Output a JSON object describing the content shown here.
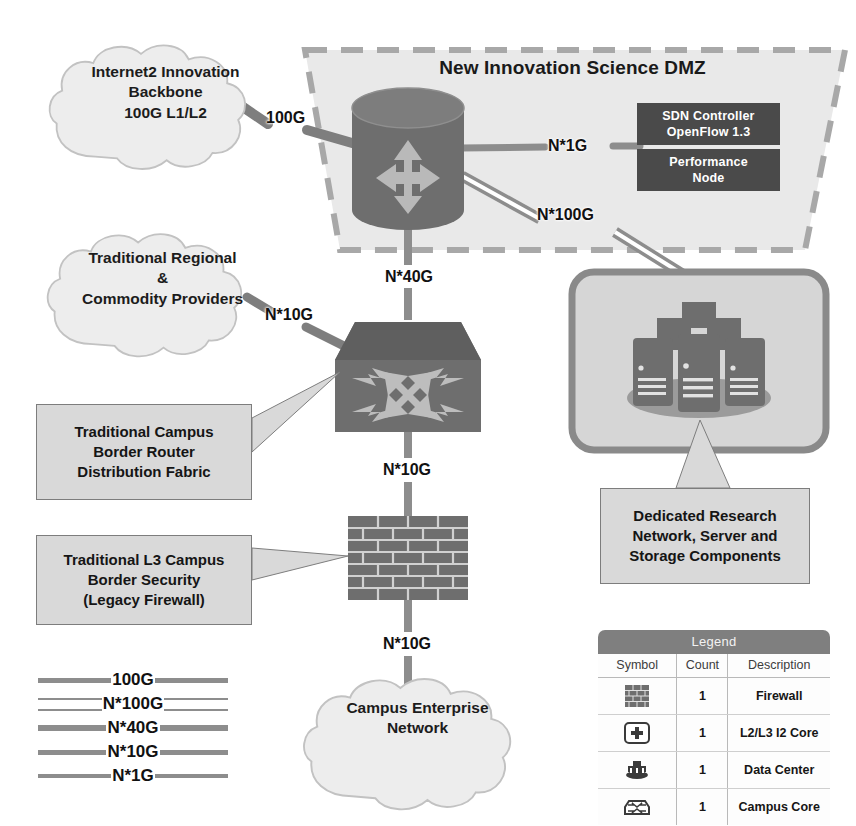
{
  "dmz": {
    "title": "New Innovation Science DMZ",
    "nodes": [
      {
        "id": "sdn-controller",
        "label": "SDN Controller\nOpenFlow 1.3",
        "line1": "SDN Controller",
        "line2": "OpenFlow 1.3"
      },
      {
        "id": "performance-node",
        "label": "Performance\nNode",
        "line1": "Performance",
        "line2": "Node"
      }
    ]
  },
  "clouds": [
    {
      "id": "internet2-backbone",
      "line1": "Internet2 Innovation",
      "line2": "Backbone",
      "line3": "100G L1/L2"
    },
    {
      "id": "regional-commodity",
      "line1": "Traditional Regional",
      "line2": "&",
      "line3": "Commodity Providers"
    },
    {
      "id": "campus-enterprise",
      "line1": "Campus Enterprise",
      "line2": "Network",
      "line3": ""
    }
  ],
  "callouts": [
    {
      "id": "border-router",
      "line1": "Traditional Campus",
      "line2": "Border Router",
      "line3": "Distribution Fabric"
    },
    {
      "id": "legacy-firewall",
      "line1": "Traditional L3 Campus",
      "line2": "Border Security",
      "line3": "(Legacy Firewall)"
    },
    {
      "id": "research-network",
      "line1": "Dedicated Research",
      "line2": "Network, Server and",
      "line3": "Storage Components"
    }
  ],
  "link_labels": {
    "internet2_to_core": "100G",
    "core_to_sdn": "N*1G",
    "core_to_datacenter": "N*100G",
    "core_to_campus_core": "N*40G",
    "regional_to_campus_core": "N*10G",
    "campus_core_to_firewall": "N*10G",
    "firewall_to_enterprise": "N*10G"
  },
  "line_legend": [
    {
      "label": "100G",
      "style": "solid",
      "thickness": 5
    },
    {
      "label": "N*100G",
      "style": "hollow",
      "thickness": 9
    },
    {
      "label": "N*40G",
      "style": "solid",
      "thickness": 6
    },
    {
      "label": "N*10G",
      "style": "solid",
      "thickness": 5
    },
    {
      "label": "N*1G",
      "style": "solid",
      "thickness": 4
    }
  ],
  "symbol_legend": {
    "title": "Legend",
    "columns": [
      "Symbol",
      "Count",
      "Description"
    ],
    "rows": [
      {
        "symbol": "firewall-brick-icon",
        "count": "1",
        "description": "Firewall"
      },
      {
        "symbol": "router-core-icon",
        "count": "1",
        "description": "L2/L3 I2 Core"
      },
      {
        "symbol": "data-center-icon",
        "count": "1",
        "description": "Data Center"
      },
      {
        "symbol": "campus-core-icon",
        "count": "1",
        "description": "Campus Core"
      }
    ]
  },
  "colors": {
    "dmz_fill": "#e8e8e8",
    "dmz_border": "#9d9d9d",
    "node_dark": "#4a4a4a",
    "node_mid": "#6b6b6b",
    "link": "#8d8d8d",
    "callout_fill": "#d9d9d9",
    "cloud_fill": "#ededed",
    "legend_header": "#7f7f7f"
  }
}
